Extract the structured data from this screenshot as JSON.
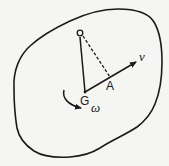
{
  "diagram": {
    "type": "rigid-body-kinematics",
    "colors": {
      "ink": "#1a1a1a",
      "paper": "#f5f5f3"
    },
    "body": {
      "name": "rigid-body-outline"
    },
    "points": {
      "O": {
        "label": "O",
        "x": 80,
        "y": 33
      },
      "G": {
        "label": "G",
        "x": 85,
        "y": 93
      },
      "A": {
        "label": "A",
        "x": 111,
        "y": 79
      }
    },
    "vectors": {
      "velocity": {
        "label": "v",
        "from": "G",
        "to": [
          137,
          61
        ]
      }
    },
    "rotation": {
      "label": "ω",
      "direction": "clockwise"
    },
    "segments": [
      {
        "from": "O",
        "to": "G",
        "style": "solid"
      },
      {
        "from": "O",
        "to": "A",
        "style": "dashed"
      }
    ]
  }
}
